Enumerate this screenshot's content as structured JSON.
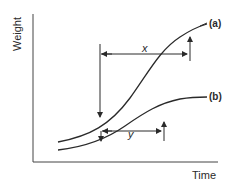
{
  "figure": {
    "axis_labels": {
      "y": "Weight",
      "x": "Time"
    },
    "curves": [
      {
        "id": "a",
        "label": "(a)"
      },
      {
        "id": "b",
        "label": "(b)"
      }
    ],
    "intervals": [
      {
        "id": "x",
        "label": "x"
      },
      {
        "id": "y",
        "label": "y"
      }
    ],
    "colors": {
      "line": "#2a2a2a",
      "background": "#ffffff"
    }
  }
}
